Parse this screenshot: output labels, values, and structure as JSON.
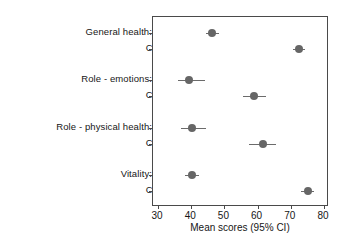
{
  "chart_data": {
    "type": "scatter",
    "title": "",
    "subtitle": "",
    "xlabel": "Mean scores (95% CI)",
    "ylabel": "",
    "xlim": [
      30,
      80
    ],
    "xticks": [
      30,
      40,
      50,
      60,
      70,
      80
    ],
    "xticklabels": [
      "30",
      "40",
      "50",
      "60",
      "70",
      "80"
    ],
    "grid": false,
    "legend": null,
    "orientation": "horizontal",
    "marker_color": "#666666",
    "errorbar_color": "#6b6b6b",
    "frame_color": "#4a4a4a",
    "groups": [
      {
        "label": "General health:",
        "rows": [
          {
            "label": "Cases",
            "value": 46.3,
            "ci_low": 44.4,
            "ci_high": 48.5
          },
          {
            "label": "Controls",
            "value": 72.4,
            "ci_low": 70.8,
            "ci_high": 74.4
          }
        ]
      },
      {
        "label": "Role - emotions:",
        "rows": [
          {
            "label": "Cases",
            "value": 39.2,
            "ci_low": 36.0,
            "ci_high": 44.2
          },
          {
            "label": "Controls",
            "value": 58.9,
            "ci_low": 55.6,
            "ci_high": 62.4
          }
        ]
      },
      {
        "label": "Role - physical health:",
        "rows": [
          {
            "label": "Cases",
            "value": 40.2,
            "ci_low": 36.8,
            "ci_high": 44.4
          },
          {
            "label": "Controls",
            "value": 61.5,
            "ci_low": 57.4,
            "ci_high": 65.6
          }
        ]
      },
      {
        "label": "Vitality:",
        "rows": [
          {
            "label": "Cases",
            "value": 40.3,
            "ci_low": 38.2,
            "ci_high": 42.4
          },
          {
            "label": "Controls",
            "value": 75.1,
            "ci_low": 73.2,
            "ci_high": 77.0
          }
        ]
      }
    ]
  }
}
